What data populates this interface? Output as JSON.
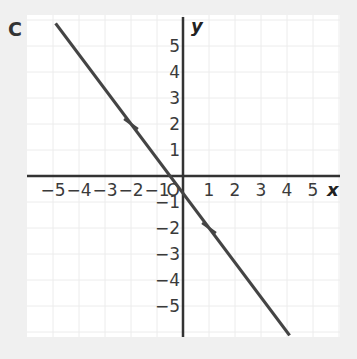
{
  "panel_label": "C",
  "chart_data": {
    "type": "line",
    "title": "",
    "xlabel": "x",
    "ylabel": "y",
    "xlim": [
      -5.9,
      6
    ],
    "ylim": [
      -6.2,
      6.1
    ],
    "grid": true,
    "x_ticks": [
      -5,
      -4,
      -3,
      -2,
      -1,
      1,
      2,
      3,
      4,
      5
    ],
    "y_ticks": [
      5,
      4,
      3,
      2,
      1,
      -1,
      -2,
      -3,
      -4,
      -5
    ],
    "origin_label": "O",
    "series": [
      {
        "name": "line",
        "equation": "y = -4/3 x - 2/3",
        "color": "#444444",
        "x": [
          -4.9,
          4.1
        ],
        "y": [
          5.87,
          -6.13
        ]
      }
    ],
    "marked_points": [
      {
        "x": -2,
        "y": 2
      },
      {
        "x": 1,
        "y": -2
      }
    ]
  }
}
